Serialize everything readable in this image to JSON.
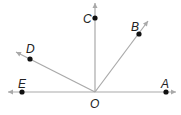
{
  "diagram": {
    "type": "geometry-rays",
    "colors": {
      "ray": "#a9a9a9",
      "point": "#111111",
      "label": "#222222"
    },
    "vertex": {
      "label": "O",
      "x": 95,
      "y": 92,
      "label_x": 90,
      "label_y": 108
    },
    "points": [
      {
        "name": "A",
        "label": "A",
        "x": 166,
        "y": 92,
        "label_x": 161,
        "label_y": 88
      },
      {
        "name": "B",
        "label": "B",
        "x": 139,
        "y": 34,
        "label_x": 131,
        "label_y": 31
      },
      {
        "name": "C",
        "label": "C",
        "x": 95,
        "y": 18,
        "label_x": 83,
        "label_y": 23
      },
      {
        "name": "D",
        "label": "D",
        "x": 30,
        "y": 59,
        "label_x": 26,
        "label_y": 53
      },
      {
        "name": "E",
        "label": "E",
        "x": 22,
        "y": 92,
        "label_x": 18,
        "label_y": 88
      }
    ],
    "rays": [
      {
        "name": "ray-OA",
        "x2": 176,
        "y2": 92
      },
      {
        "name": "ray-OE",
        "x2": 8,
        "y2": 92
      },
      {
        "name": "ray-OC",
        "x2": 95,
        "y2": 3
      },
      {
        "name": "ray-OB",
        "x2": 148,
        "y2": 21
      },
      {
        "name": "ray-OD",
        "x2": 16,
        "y2": 52
      }
    ]
  }
}
